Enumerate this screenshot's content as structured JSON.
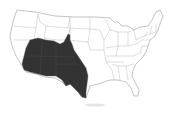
{
  "map": {
    "subject": "United States state outline map",
    "highlighted_region": "Southwestern United States",
    "highlight_color": "#333333",
    "background_color": "#ffffff",
    "border_color": "#9a9a9a"
  }
}
